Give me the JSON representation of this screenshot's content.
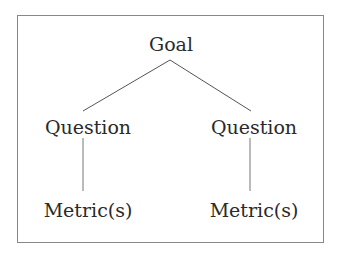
{
  "diagram": {
    "type": "tree",
    "root": {
      "label": "Goal"
    },
    "questions": [
      {
        "label": "Question"
      },
      {
        "label": "Question"
      }
    ],
    "metrics": [
      {
        "label": "Metric(s)"
      },
      {
        "label": "Metric(s)"
      }
    ],
    "colors": {
      "line": "#555555",
      "border": "#888888",
      "text": "#2a2a2a"
    }
  }
}
